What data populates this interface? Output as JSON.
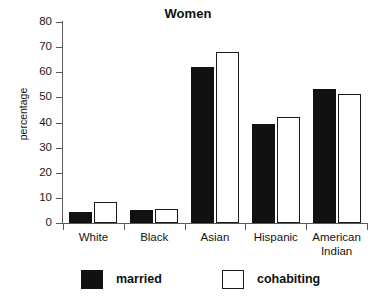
{
  "chart_data": {
    "type": "bar",
    "title": "Women",
    "xlabel": "",
    "ylabel": "percentage",
    "ylim": [
      0,
      80
    ],
    "yticks": [
      0,
      10,
      20,
      30,
      40,
      50,
      60,
      70,
      80
    ],
    "grid": false,
    "legend_position": "bottom",
    "categories": [
      "White",
      "Black",
      "Asian",
      "Hispanic",
      "American Indian"
    ],
    "category_lines": [
      [
        "White"
      ],
      [
        "Black"
      ],
      [
        "Asian"
      ],
      [
        "Hispanic"
      ],
      [
        "American",
        "Indian"
      ]
    ],
    "series": [
      {
        "name": "married",
        "color": "#111111",
        "style": "filled",
        "values": [
          4.5,
          5.0,
          62.0,
          39.5,
          53.5
        ]
      },
      {
        "name": "cohabiting",
        "color": "#ffffff",
        "style": "hollow",
        "values": [
          8.5,
          5.5,
          68.0,
          42.0,
          51.5
        ]
      }
    ]
  },
  "legend": {
    "items": [
      {
        "label": "married",
        "swatch": "filled-square-black"
      },
      {
        "label": "cohabiting",
        "swatch": "hollow-square-outline"
      }
    ]
  },
  "colors": {
    "background": "#ffffff",
    "axis": "#5a5a5a",
    "text": "#111111",
    "married": "#111111",
    "cohabiting": "#ffffff"
  }
}
